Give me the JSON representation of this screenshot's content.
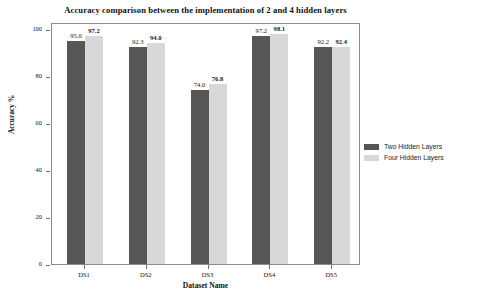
{
  "chart_data": {
    "type": "bar",
    "title": "Accuracy comparison between the implementation of 2 and 4 hidden layers",
    "xlabel": "Dataset Name",
    "ylabel": "Accuracy %",
    "categories": [
      "DS1",
      "DS2",
      "DS3",
      "DS4",
      "DS5"
    ],
    "series": [
      {
        "name": "Two Hidden Layers",
        "color": "#565656",
        "values": [
          95.0,
          92.3,
          74.0,
          97.2,
          92.2
        ],
        "labels": [
          "95.0",
          "92.3",
          "74.0",
          "97.2",
          "92.2"
        ]
      },
      {
        "name": "Four Hidden Layers",
        "color": "#d8d8d8",
        "values": [
          97.2,
          94.0,
          76.8,
          98.1,
          92.4
        ],
        "labels": [
          "97.2",
          "94.0",
          "76.8",
          "98.1",
          "92.4"
        ]
      }
    ],
    "ylim": [
      0,
      103
    ],
    "yticks": [
      0,
      20,
      40,
      60,
      80,
      100
    ],
    "ytick_labels": [
      "0",
      "20",
      "40",
      "60",
      "80",
      "100"
    ],
    "grid": false,
    "legend_position": "right"
  },
  "legend": {
    "entries": [
      {
        "label": "Two Hidden Layers"
      },
      {
        "label": "Four Hidden Layers"
      }
    ]
  }
}
